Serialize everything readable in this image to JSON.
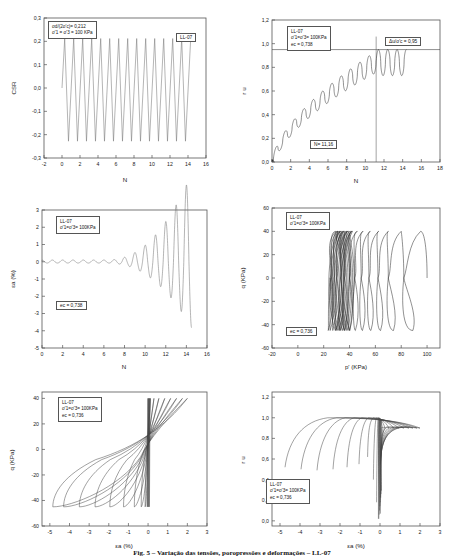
{
  "figure": {
    "caption": "Fig. 5 – Variação das tensões, poropressões e deformações – LL-07",
    "specimen": "LL-07"
  },
  "chart_data": [
    {
      "id": "csr-vs-n",
      "type": "line",
      "position": "top-left",
      "title": "",
      "xlabel": "N",
      "ylabel": "CSR",
      "xlim": [
        -2,
        16
      ],
      "ylim": [
        -0.3,
        0.3
      ],
      "xticks": [
        -2,
        0,
        2,
        4,
        6,
        8,
        10,
        12,
        14,
        16
      ],
      "xticklabels": [
        "-2",
        "0",
        "2",
        "4",
        "6",
        "8",
        "10",
        "12",
        "14",
        "16"
      ],
      "yticks": [
        -0.3,
        -0.2,
        -0.1,
        0.0,
        0.1,
        0.2,
        0.3
      ],
      "yticklabels": [
        "-0,3",
        "-0,2",
        "-0,1",
        "0,0",
        "0,1",
        "0,2",
        "0,3"
      ],
      "grid": false,
      "amplitude_positive": 0.212,
      "amplitude_negative": -0.228,
      "cycles": 14,
      "cycle_start": 0.2,
      "cycle_period": 1.0,
      "annotations": [
        {
          "name": "test-conditions",
          "lines": [
            "σd/(2σ'c)= 0,212",
            "σ'1 = σ'3 = 100 KPa"
          ]
        },
        {
          "name": "specimen-tag",
          "lines": [
            "LL-07"
          ]
        }
      ]
    },
    {
      "id": "ru-vs-n",
      "type": "line",
      "position": "top-right",
      "xlabel": "N",
      "ylabel": "r u",
      "xlim": [
        0,
        18
      ],
      "ylim": [
        0.0,
        1.2
      ],
      "xticks": [
        0,
        2,
        4,
        6,
        8,
        10,
        12,
        14,
        16,
        18
      ],
      "xticklabels": [
        "0",
        "2",
        "4",
        "6",
        "8",
        "10",
        "12",
        "14",
        "16",
        "18"
      ],
      "yticks": [
        0.0,
        0.2,
        0.4,
        0.6,
        0.8,
        1.0,
        1.2
      ],
      "yticklabels": [
        "0,0",
        "0,2",
        "0,4",
        "0,6",
        "0,8",
        "1,0",
        "1,2"
      ],
      "grid": false,
      "liquefaction_line_y": 0.95,
      "liquefaction_line_x": 11.16,
      "annotations": [
        {
          "name": "test-conditions",
          "lines": [
            "LL-07",
            "σ'1=σ'3= 100KPa",
            "ec = 0,738"
          ]
        },
        {
          "name": "pore-pressure-ratio",
          "lines": [
            "Δu/σ'c = 0,95"
          ]
        },
        {
          "name": "liquefaction-cycles",
          "lines": [
            "N= 11,16"
          ]
        }
      ]
    },
    {
      "id": "strain-vs-n",
      "type": "line",
      "position": "middle-left",
      "xlabel": "N",
      "ylabel": "εa (%)",
      "xlim": [
        0,
        16
      ],
      "ylim": [
        -5,
        3
      ],
      "xticks": [
        0,
        2,
        4,
        6,
        8,
        10,
        12,
        14,
        16
      ],
      "xticklabels": [
        "0",
        "2",
        "4",
        "6",
        "8",
        "10",
        "12",
        "14",
        "16"
      ],
      "yticks": [
        -5,
        -4,
        -3,
        -2,
        -1,
        0,
        1,
        2,
        3
      ],
      "yticklabels": [
        "-5",
        "-4",
        "-3",
        "-2",
        "-1",
        "0",
        "1",
        "2",
        "3"
      ],
      "grid": false,
      "annotations": [
        {
          "name": "test-conditions",
          "lines": [
            "LL-07",
            "σ'1=σ'3= 100KPa"
          ]
        },
        {
          "name": "void-ratio",
          "lines": [
            "ec = 0,738"
          ]
        }
      ]
    },
    {
      "id": "q-vs-p-prime",
      "type": "line",
      "position": "middle-right",
      "xlabel": "p' (KPa)",
      "ylabel": "q (KPa)",
      "xlim": [
        -20,
        110
      ],
      "ylim": [
        -60,
        60
      ],
      "xticks": [
        -20,
        0,
        20,
        40,
        60,
        80,
        100
      ],
      "xticklabels": [
        "-20",
        "0",
        "20",
        "40",
        "60",
        "80",
        "100"
      ],
      "yticks": [
        -60,
        -40,
        -20,
        0,
        20,
        40,
        60
      ],
      "yticklabels": [
        "-60",
        "-40",
        "-20",
        "0",
        "20",
        "40",
        "60"
      ],
      "grid": false,
      "q_max": 40,
      "q_min": -45,
      "p_initial": 100,
      "annotations": [
        {
          "name": "test-conditions",
          "lines": [
            "LL-07",
            "σ'1=σ'3= 100KPa"
          ]
        },
        {
          "name": "void-ratio",
          "lines": [
            "ec = 0,736"
          ]
        }
      ]
    },
    {
      "id": "q-vs-strain",
      "type": "line",
      "position": "bottom-left",
      "xlabel": "εa (%)",
      "ylabel": "q (KPa)",
      "xlim": [
        -5.4,
        3
      ],
      "ylim": [
        -60,
        45
      ],
      "xticks": [
        -5,
        -4,
        -3,
        -2,
        -1,
        0,
        1,
        2,
        3
      ],
      "xticklabels": [
        "-5",
        "-4",
        "-3",
        "-2",
        "-1",
        "0",
        "1",
        "2",
        "3"
      ],
      "yticks": [
        -60,
        -40,
        -20,
        0,
        20,
        40
      ],
      "yticklabels": [
        "-60",
        "-40",
        "-20",
        "0",
        "20",
        "40"
      ],
      "grid": false,
      "annotations": [
        {
          "name": "test-conditions",
          "lines": [
            "LL-07",
            "σ'1=σ'3= 100KPa",
            "ec = 0,736"
          ]
        }
      ]
    },
    {
      "id": "ru-vs-strain",
      "type": "line",
      "position": "bottom-right",
      "xlabel": "εa (%)",
      "ylabel": "r u",
      "xlim": [
        -5.4,
        3
      ],
      "ylim": [
        -0.05,
        1.25
      ],
      "xticks": [
        -5,
        -4,
        -3,
        -2,
        -1,
        0,
        1,
        2,
        3
      ],
      "xticklabels": [
        "-5",
        "-4",
        "-3",
        "-2",
        "-1",
        "0",
        "1",
        "2",
        "3"
      ],
      "yticks": [
        0.0,
        0.2,
        0.4,
        0.6,
        0.8,
        1.0,
        1.2
      ],
      "yticklabels": [
        "0,0",
        "0,2",
        "0,4",
        "0,6",
        "0,8",
        "1,0",
        "1,2"
      ],
      "grid": false,
      "annotations": [
        {
          "name": "test-conditions",
          "lines": [
            "LL-07",
            "σ'1=σ'3= 100KPa",
            "ec = 0,736"
          ]
        }
      ]
    }
  ]
}
